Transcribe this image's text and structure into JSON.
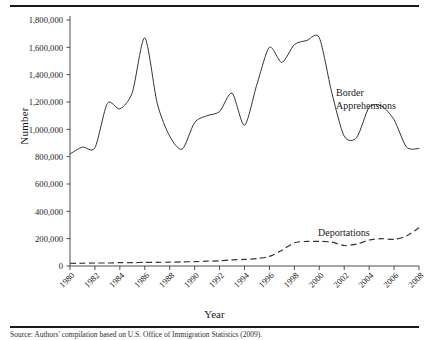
{
  "figure": {
    "ylabel": "Number",
    "xlabel": "Year",
    "source_note": "Source: Authors' compilation based on U.S. Office of Immigration Statistics (2009)."
  },
  "chart_data": {
    "type": "line",
    "title": "",
    "subtitle": "",
    "xlabel": "Year",
    "ylabel": "Number",
    "xlim": [
      1980,
      2008
    ],
    "ylim": [
      0,
      1800000
    ],
    "grid": false,
    "legend_position": "inline-annotation",
    "x_tick_labels": [
      "1980",
      "1982",
      "1984",
      "1986",
      "1988",
      "1990",
      "1992",
      "1994",
      "1996",
      "1998",
      "2000",
      "2002",
      "2004",
      "2006",
      "2008"
    ],
    "y_tick_labels": [
      "0",
      "200,000",
      "400,000",
      "600,000",
      "800,000",
      "1,000,000",
      "1,200,000",
      "1,400,000",
      "1,600,000",
      "1,800,000"
    ],
    "y_tick_values": [
      0,
      200000,
      400000,
      600000,
      800000,
      1000000,
      1200000,
      1400000,
      1600000,
      1800000
    ],
    "x": [
      1980,
      1981,
      1982,
      1983,
      1984,
      1985,
      1986,
      1987,
      1988,
      1989,
      1990,
      1991,
      1992,
      1993,
      1994,
      1995,
      1996,
      1997,
      1998,
      1999,
      2000,
      2001,
      2002,
      2003,
      2004,
      2005,
      2006,
      2007,
      2008
    ],
    "series": [
      {
        "name": "Border Apprehensions",
        "style": "solid",
        "values": [
          820000,
          870000,
          865000,
          1190000,
          1150000,
          1270000,
          1670000,
          1190000,
          950000,
          855000,
          1050000,
          1100000,
          1130000,
          1265000,
          1030000,
          1330000,
          1600000,
          1490000,
          1620000,
          1650000,
          1670000,
          1270000,
          950000,
          940000,
          1160000,
          1170000,
          1070000,
          870000,
          860000
        ]
      },
      {
        "name": "Deportations",
        "style": "dashed",
        "values": [
          20000,
          20000,
          22000,
          22000,
          25000,
          25000,
          26000,
          27000,
          28000,
          30000,
          32000,
          35000,
          38000,
          45000,
          48000,
          55000,
          70000,
          115000,
          170000,
          180000,
          180000,
          175000,
          150000,
          160000,
          190000,
          200000,
          195000,
          220000,
          280000
        ]
      }
    ],
    "annotations": [
      {
        "text": "Border Apprehensions",
        "kind": "series-label",
        "series": "Border Apprehensions"
      },
      {
        "text": "Deportations",
        "kind": "series-label",
        "series": "Deportations"
      }
    ]
  }
}
